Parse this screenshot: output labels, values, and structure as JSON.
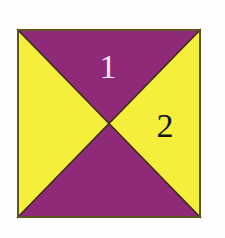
{
  "figure": {
    "name": "square-divided-by-diagonals",
    "background_color": "#fefefe",
    "square": {
      "x": 17,
      "y": 29,
      "width": 184,
      "height": 189,
      "border_color": "#5d5420",
      "border_width": 2
    },
    "center": {
      "x": 109,
      "y": 123.5
    },
    "regions": [
      {
        "id": "top",
        "name": "top-triangle",
        "fill": "#8e2a78",
        "color_name": "purple",
        "label": "1",
        "label_color": "#f2e8f2",
        "label_x": 108,
        "label_y": 78
      },
      {
        "id": "right",
        "name": "right-triangle",
        "fill": "#f5ef3c",
        "color_name": "yellow",
        "label": "2",
        "label_color": "#121212",
        "label_x": 165,
        "label_y": 137
      },
      {
        "id": "bottom",
        "name": "bottom-triangle",
        "fill": "#8e2a78",
        "color_name": "purple",
        "label": "",
        "label_color": "#f2e8f2",
        "label_x": 108,
        "label_y": 190
      },
      {
        "id": "left",
        "name": "left-triangle",
        "fill": "#f5ef3c",
        "color_name": "yellow",
        "label": "",
        "label_color": "#121212",
        "label_x": 52,
        "label_y": 137
      }
    ],
    "diagonals": {
      "stroke": "#3a2a18",
      "stroke_width": 1.6
    }
  }
}
